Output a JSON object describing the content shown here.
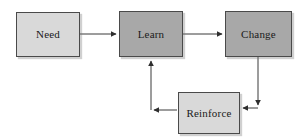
{
  "diagram": {
    "type": "flowchart",
    "title": "",
    "width": 303,
    "height": 139,
    "background_color": "#ffffff",
    "nodes": [
      {
        "id": "need",
        "label": "Need",
        "shape": "rectangle",
        "fill_color": "#d9d9d9",
        "border_color": "#4a4a4a",
        "text_color": "#1a1a1a",
        "x": 16,
        "y": 12,
        "width": 64,
        "height": 45
      },
      {
        "id": "learn",
        "label": "Learn",
        "shape": "rectangle",
        "fill_color": "#a8a8a8",
        "border_color": "#4a4a4a",
        "text_color": "#1a1a1a",
        "x": 119,
        "y": 11,
        "width": 64,
        "height": 46
      },
      {
        "id": "change",
        "label": "Change",
        "shape": "rectangle",
        "fill_color": "#a8a8a8",
        "border_color": "#4a4a4a",
        "text_color": "#1a1a1a",
        "x": 225,
        "y": 11,
        "width": 67,
        "height": 46
      },
      {
        "id": "reinforce",
        "label": "Reinforce",
        "shape": "rectangle",
        "fill_color": "#d9d9d9",
        "border_color": "#4a4a4a",
        "text_color": "#1a1a1a",
        "x": 178,
        "y": 92,
        "width": 62,
        "height": 42
      }
    ],
    "edges": [
      {
        "id": "need-to-learn",
        "from": "need",
        "to": "learn",
        "label": "",
        "style": "straight",
        "color": "#3a3a3a",
        "arrowhead": "right",
        "path": "M 80 34 L 117 34"
      },
      {
        "id": "learn-to-change",
        "from": "learn",
        "to": "change",
        "label": "",
        "style": "straight",
        "color": "#3a3a3a",
        "arrowhead": "right",
        "path": "M 183 34 L 223 34"
      },
      {
        "id": "change-to-reinforce",
        "from": "change",
        "to": "reinforce",
        "label": "",
        "style": "elbow",
        "color": "#3a3a3a",
        "arrowhead": "left",
        "path": "M 258 57 L 258 108 L 242 108"
      },
      {
        "id": "reinforce-to-learn",
        "from": "reinforce",
        "to": "learn",
        "label": "",
        "style": "elbow",
        "color": "#3a3a3a",
        "arrowhead": "up",
        "path": "M 178 110 L 151 110 L 151 59"
      }
    ]
  }
}
